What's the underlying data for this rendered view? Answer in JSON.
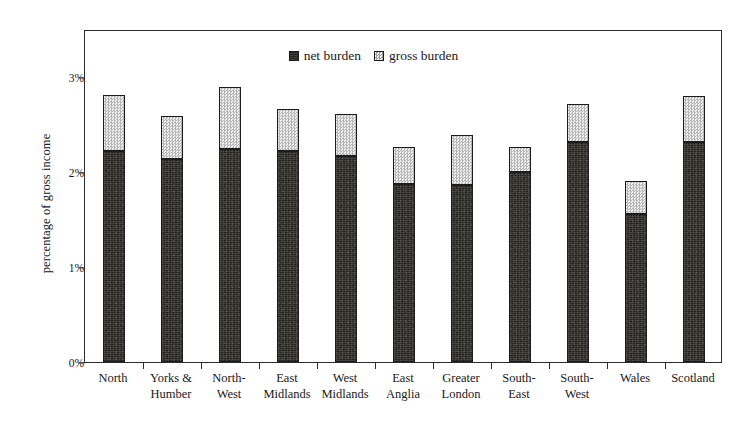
{
  "chart_data": {
    "type": "bar",
    "stacked": true,
    "title": "",
    "xlabel": "",
    "ylabel": "percentage of gross income",
    "ylim": [
      0,
      3.5
    ],
    "yticks": [
      0,
      1,
      2,
      3
    ],
    "ytick_labels": [
      "0%",
      "1%",
      "2%",
      "3%"
    ],
    "grid": false,
    "legend_position": "top-center",
    "categories": [
      "North",
      "Yorks & Humber",
      "North-West",
      "East Midlands",
      "West Midlands",
      "East Anglia",
      "Greater London",
      "South-East",
      "South-West",
      "Wales",
      "Scotland"
    ],
    "category_lines": [
      [
        "North"
      ],
      [
        "Yorks &",
        "Humber"
      ],
      [
        "North-",
        "West"
      ],
      [
        "East",
        "Midlands"
      ],
      [
        "West",
        "Midlands"
      ],
      [
        "East",
        "Anglia"
      ],
      [
        "Greater",
        "London"
      ],
      [
        "South-",
        "East"
      ],
      [
        "South-",
        "West"
      ],
      [
        "Wales"
      ],
      [
        "Scotland"
      ]
    ],
    "series": [
      {
        "name": "net burden",
        "color": "#26241f",
        "values": [
          2.22,
          2.14,
          2.24,
          2.22,
          2.17,
          1.87,
          1.86,
          2.0,
          2.32,
          1.56,
          2.32
        ]
      },
      {
        "name": "gross burden",
        "color": "#dedede",
        "values": [
          0.59,
          0.45,
          0.65,
          0.44,
          0.44,
          0.39,
          0.53,
          0.26,
          0.4,
          0.35,
          0.48
        ]
      }
    ],
    "totals": [
      2.81,
      2.59,
      2.89,
      2.66,
      2.61,
      2.26,
      2.39,
      2.26,
      2.72,
      1.91,
      2.8
    ]
  },
  "legend": {
    "entries": [
      {
        "label": "net burden",
        "swatch": "net-burden-swatch"
      },
      {
        "label": "gross burden",
        "swatch": "gross-burden-swatch"
      }
    ]
  }
}
